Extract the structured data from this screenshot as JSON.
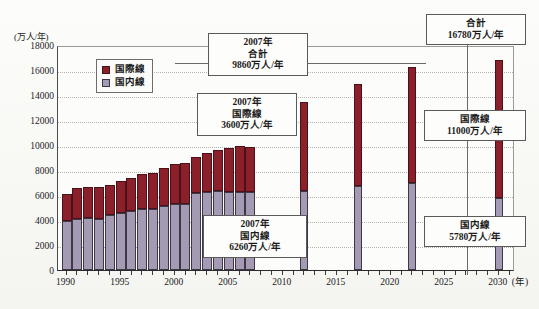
{
  "chart_data": {
    "type": "bar",
    "title": "",
    "subtitle": "",
    "stacked": true,
    "ylabel": "(万人/年)",
    "xlabel": "(年)",
    "ylim": [
      0,
      18000
    ],
    "ytick_step": 2000,
    "yticks": [
      "18000",
      "16000",
      "14000",
      "12000",
      "10000",
      "8000",
      "6000",
      "4000",
      "2000",
      "0"
    ],
    "xlim": [
      1989.2,
      2031.5
    ],
    "xticks": [
      "1990",
      "1995",
      "2000",
      "2005",
      "2010",
      "2015",
      "2020",
      "2025",
      "2030"
    ],
    "grid": "horizontal-dotted",
    "legend_position": "inside-top-left",
    "legend": [
      {
        "name": "国際線",
        "color": "#8b1f2a"
      },
      {
        "name": "国内線",
        "color": "#a49ab4"
      }
    ],
    "categories": [
      "1990",
      "1991",
      "1992",
      "1993",
      "1994",
      "1995",
      "1996",
      "1997",
      "1998",
      "1999",
      "2000",
      "2001",
      "2002",
      "2003",
      "2004",
      "2005",
      "2006",
      "2007",
      "2012",
      "2017",
      "2022",
      "2030"
    ],
    "series": [
      {
        "name": "国内線",
        "color": "#a49ab4",
        "values": [
          3960,
          4120,
          4180,
          4100,
          4380,
          4540,
          4760,
          4880,
          4880,
          5100,
          5320,
          5280,
          6200,
          6280,
          6300,
          6260,
          6280,
          6260,
          6300,
          6700,
          6960,
          5780
        ]
      },
      {
        "name": "国際線",
        "color": "#8b1f2a",
        "values": [
          2140,
          2480,
          2440,
          2540,
          2460,
          2540,
          2600,
          2800,
          2920,
          3020,
          3180,
          3280,
          2820,
          3060,
          3320,
          3540,
          3620,
          3600,
          7100,
          8160,
          9300,
          11000
        ]
      }
    ],
    "annotations": [
      {
        "id": "c2007-total",
        "lines": [
          "2007年",
          "合計",
          "9860万人/年"
        ]
      },
      {
        "id": "c2007-intl",
        "lines": [
          "2007年",
          "国際線",
          "3600万人/年"
        ]
      },
      {
        "id": "c2007-dom",
        "lines": [
          "2007年",
          "国内線",
          "6260万人/年"
        ]
      },
      {
        "id": "c2030-total",
        "lines": [
          "合計",
          "16780万人/年"
        ]
      },
      {
        "id": "c2030-intl",
        "lines": [
          "国際線",
          "11000万人/年"
        ]
      },
      {
        "id": "c2030-dom",
        "lines": [
          "国内線",
          "5780万人/年"
        ]
      }
    ]
  }
}
